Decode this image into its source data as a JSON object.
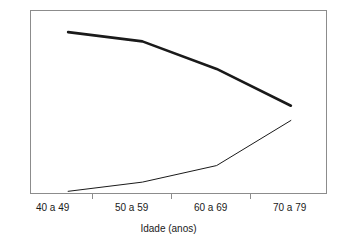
{
  "chart_data": {
    "type": "line",
    "title": "",
    "subtitle": "",
    "xlabel": "Idade (anos)",
    "ylabel": "",
    "categories": [
      "40 a 49",
      "50 a 59",
      "60 a 69",
      "70 a 79"
    ],
    "x": [
      0,
      1,
      2,
      3
    ],
    "xlim": [
      -0.5,
      3.5
    ],
    "ylim": [
      0,
      100
    ],
    "grid": false,
    "legend": null,
    "legend_position": "none",
    "y_axis_visible": false,
    "y_ticks": [],
    "series": [
      {
        "name": "serie-decrescente",
        "style": "thick",
        "color": "#1a1a1a",
        "width": 2.6,
        "values": [
          88.5,
          83.5,
          68.5,
          48.5
        ]
      },
      {
        "name": "serie-crescente",
        "style": "thin",
        "color": "#1a1a1a",
        "width": 1.0,
        "values": [
          2.0,
          7.0,
          16.0,
          40.5
        ]
      }
    ],
    "annotations": []
  },
  "axis": {
    "x_tick_labels": [
      "40 a 49",
      "50 a 59",
      "60 a 69",
      "70 a 79"
    ],
    "x_title": "Idade (anos)",
    "tick_positions_pct": [
      20.9,
      47.5,
      74.1
    ],
    "label_positions_pct": [
      7.6,
      34.2,
      60.8,
      87.4
    ]
  },
  "colors": {
    "frame": "#8c8c8c",
    "line": "#1a1a1a",
    "background": "#ffffff",
    "text": "#1a1a1a"
  }
}
